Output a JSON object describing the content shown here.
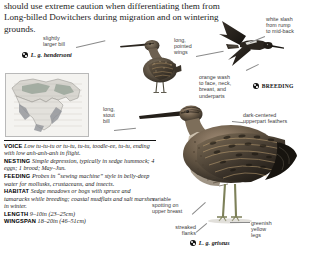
{
  "intro": {
    "text": "should use extreme caution when differentiating them from Long-billed Dowitchers during migration and on wintering grounds."
  },
  "labels": {
    "slightly_larger_bill": "slightly\nlarger bill",
    "long_pointed_wings": "long,\npointed\nwings",
    "white_slash": "white slash\nfrom rump\nto mid-back",
    "orange_wash": "orange wash\nto face, neck,\nbreast, and\nunderparts",
    "dark_centered": "dark-centered\nupperpart feathers",
    "long_stout_bill": "long,\nstout\nbill",
    "variable_spotting": "variable\nspotting on\nupper breast",
    "streaked_flanks": "streaked\nflanks",
    "greenish_yellow_legs": "greenish\nyellow\nlegs"
  },
  "subspecies": {
    "hendersoni": "L. g. hendersoni",
    "griseus": "L. g. griseus",
    "breeding": "BREEDING"
  },
  "facts": [
    {
      "term": "VOICE",
      "text": "Low tu-tu-tu or tu-tu, tu-tu, toodle-ee, tu-tu, ending with low anh-anh-anh in flight."
    },
    {
      "term": "NESTING",
      "text": "Simple depression, typically in sedge hummock; 4 eggs; 1 brood; May–Jun."
    },
    {
      "term": "FEEDING",
      "text": "Probes in “sewing machine” style in belly-deep water for mollusks, crustaceans, and insects."
    },
    {
      "term": "HABITAT",
      "text": "Sedge meadows or bogs with spruce and tamaracks while breeding; coastal mudflats and salt marshes in winter."
    },
    {
      "term": "LENGTH",
      "text": "9–10in (23–25cm)"
    },
    {
      "term": "WINGSPAN",
      "text": "18–20in (46–51cm)"
    }
  ],
  "colors": {
    "body_text": "#1b1b1b",
    "label_text": "#3a3a3a",
    "leader_line": "#8a8a8a",
    "map_breeding": "#9aa69a",
    "map_winter": "#8f9298",
    "rule": "#111111"
  }
}
